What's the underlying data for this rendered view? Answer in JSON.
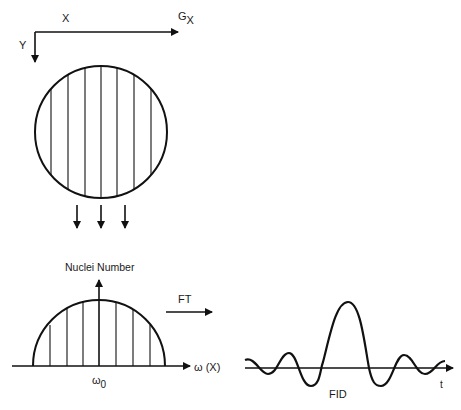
{
  "top_panel": {
    "axis_x_label": "X",
    "axis_y_label": "Y",
    "gradient_label": "G",
    "gradient_subscript": "X",
    "slices": 7,
    "projection_arrows": 3
  },
  "spectrum_panel": {
    "y_axis_label": "Nuclei Number",
    "x_axis_label": "ω (X)",
    "center_label": "ω",
    "center_subscript": "0"
  },
  "transform": {
    "label": "FT"
  },
  "fid_panel": {
    "x_axis_label": "t",
    "caption": "FID"
  },
  "colors": {
    "ink": "#111111",
    "background": "#ffffff"
  }
}
